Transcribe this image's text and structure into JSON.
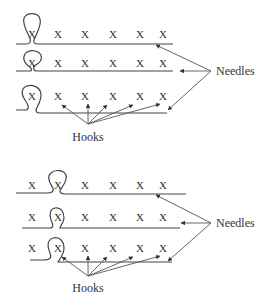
{
  "diagram": {
    "panels": [
      {
        "id": "panel-1",
        "rows": [
          {
            "marks": [
              "X",
              "X",
              "X",
              "X",
              "X",
              "X"
            ],
            "loop_at_index": 0
          },
          {
            "marks": [
              "X",
              "X",
              "X",
              "X",
              "X",
              "X"
            ],
            "loop_at_index": 0
          },
          {
            "marks": [
              "X",
              "X",
              "X",
              "X",
              "X",
              "X"
            ],
            "loop_at_index": 0
          }
        ],
        "needles_label": "Needles",
        "hooks_label": "Hooks"
      },
      {
        "id": "panel-2",
        "rows": [
          {
            "marks": [
              "X",
              "X",
              "X",
              "X",
              "X",
              "X"
            ],
            "loop_at_index": 1
          },
          {
            "marks": [
              "X",
              "X",
              "X",
              "X",
              "X",
              "X"
            ],
            "loop_at_index": 1
          },
          {
            "marks": [
              "X",
              "X",
              "X",
              "X",
              "X",
              "X"
            ],
            "loop_at_index": 1
          }
        ],
        "needles_label": "Needles",
        "hooks_label": "Hooks"
      }
    ],
    "colors": {
      "line": "#444444",
      "text": "#333333",
      "background": "#ffffff"
    }
  }
}
